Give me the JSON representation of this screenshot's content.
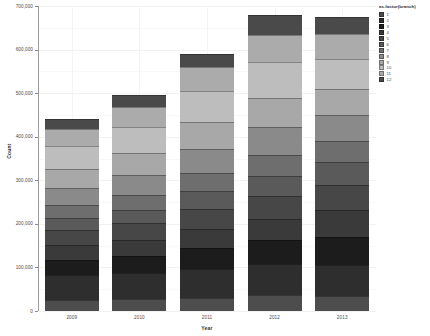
{
  "chart_data": {
    "type": "bar",
    "stacked": true,
    "title": "",
    "xlabel": "Year",
    "ylabel": "Count",
    "categories": [
      "2009",
      "2010",
      "2011",
      "2012",
      "2013"
    ],
    "ylim": [
      0,
      700000
    ],
    "yticks": [
      0,
      100000,
      200000,
      300000,
      400000,
      500000,
      600000,
      700000
    ],
    "ytick_labels": [
      "0",
      "100,000",
      "200,000",
      "300,000",
      "400,000",
      "500,000",
      "600,000",
      "700,000"
    ],
    "grid": true,
    "legend": {
      "title": "as.factor(branch)",
      "position": "right",
      "entries": [
        {
          "label": "1",
          "color": "#4d4d4d"
        },
        {
          "label": "2",
          "color": "#2e2e2e"
        },
        {
          "label": "3",
          "color": "#1c1c1c"
        },
        {
          "label": "4",
          "color": "#3a3a3a"
        },
        {
          "label": "5",
          "color": "#474747"
        },
        {
          "label": "6",
          "color": "#5a5a5a"
        },
        {
          "label": "7",
          "color": "#6e6e6e"
        },
        {
          "label": "8",
          "color": "#8a8a8a"
        },
        {
          "label": "9",
          "color": "#a8a8a8"
        },
        {
          "label": "10",
          "color": "#bdbdbd"
        },
        {
          "label": "11",
          "color": "#ababab"
        },
        {
          "label": "12",
          "color": "#4a4a4a"
        }
      ]
    },
    "series": [
      {
        "name": "1",
        "values": [
          26000,
          27000,
          31000,
          36000,
          35000
        ]
      },
      {
        "name": "2",
        "values": [
          56000,
          60000,
          66000,
          72000,
          70000
        ]
      },
      {
        "name": "3",
        "values": [
          36000,
          40000,
          48000,
          54000,
          66000
        ]
      },
      {
        "name": "4",
        "values": [
          33000,
          36000,
          44000,
          50000,
          60000
        ]
      },
      {
        "name": "5",
        "values": [
          34000,
          38000,
          46000,
          52000,
          58000
        ]
      },
      {
        "name": "6",
        "values": [
          28000,
          32000,
          40000,
          46000,
          52000
        ]
      },
      {
        "name": "7",
        "values": [
          30000,
          34000,
          42000,
          48000,
          50000
        ]
      },
      {
        "name": "8",
        "values": [
          40000,
          46000,
          56000,
          64000,
          60000
        ]
      },
      {
        "name": "9",
        "values": [
          44000,
          50000,
          60000,
          68000,
          58000
        ]
      },
      {
        "name": "10",
        "values": [
          52000,
          60000,
          72000,
          82000,
          70000
        ]
      },
      {
        "name": "11",
        "values": [
          40000,
          46000,
          55000,
          62000,
          56000
        ]
      },
      {
        "name": "12",
        "values": [
          21000,
          26000,
          30000,
          46000,
          40000
        ]
      }
    ],
    "totals": [
      440000,
      495000,
      590000,
      680000,
      665000
    ]
  }
}
